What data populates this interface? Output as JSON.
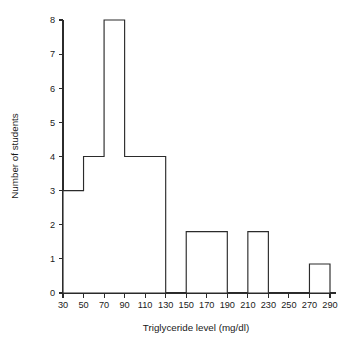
{
  "chart_data": {
    "type": "bar",
    "subtype": "histogram",
    "title": "",
    "xlabel": "Triglyceride level (mg/dl)",
    "ylabel": "Number of students",
    "xlim": [
      30,
      290
    ],
    "ylim": [
      0,
      8
    ],
    "grid": false,
    "legend": null,
    "legend_position": "none",
    "bar_fill": "#ffffff",
    "bar_stroke": "#2b2b2b",
    "axis_color": "#2b2b2b",
    "xticks": [
      30,
      50,
      70,
      90,
      110,
      130,
      150,
      170,
      190,
      210,
      230,
      250,
      270,
      290
    ],
    "xtick_labels": [
      "30",
      "50",
      "70",
      "90",
      "110",
      "130",
      "150",
      "170",
      "190",
      "210",
      "230",
      "250",
      "270",
      "290"
    ],
    "yticks": [
      0,
      1,
      2,
      3,
      4,
      5,
      6,
      7,
      8
    ],
    "ytick_labels": [
      "0",
      "1",
      "2",
      "3",
      "4",
      "5",
      "6",
      "7",
      "8"
    ],
    "bins": [
      {
        "start": 30,
        "end": 50,
        "value": 3
      },
      {
        "start": 50,
        "end": 70,
        "value": 4
      },
      {
        "start": 70,
        "end": 90,
        "value": 8
      },
      {
        "start": 90,
        "end": 130,
        "value": 4
      },
      {
        "start": 130,
        "end": 150,
        "value": 0
      },
      {
        "start": 150,
        "end": 190,
        "value": 1.8
      },
      {
        "start": 190,
        "end": 210,
        "value": 0
      },
      {
        "start": 210,
        "end": 230,
        "value": 1.8
      },
      {
        "start": 230,
        "end": 270,
        "value": 0
      },
      {
        "start": 270,
        "end": 290,
        "value": 0.85
      }
    ],
    "categories": [
      "30-50",
      "50-70",
      "70-90",
      "90-130",
      "130-150",
      "150-190",
      "190-210",
      "210-230",
      "230-270",
      "270-290"
    ],
    "values": [
      3,
      4,
      8,
      4,
      0,
      1.8,
      0,
      1.8,
      0,
      0.85
    ]
  }
}
